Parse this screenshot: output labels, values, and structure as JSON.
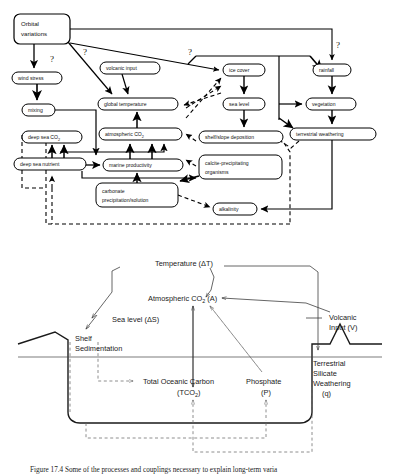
{
  "figure": {
    "caption_partial": "Figure 17.4    Some of the processes and couplings necessary to explain long-term varia"
  },
  "top_diagram": {
    "name": "climate-carbon-cycle-feedback-box-diagram",
    "nodes": [
      {
        "id": "orbital_variations",
        "label_lines": [
          "Orbital",
          "variations"
        ],
        "shape": "rounded-box",
        "x": 14,
        "y": 14,
        "w": 56,
        "h": 30
      },
      {
        "id": "wind_stress",
        "label": "wind stress",
        "shape": "pill",
        "x": 12,
        "y": 72,
        "w": 50,
        "h": 12
      },
      {
        "id": "mixing",
        "label": "mixing",
        "shape": "pill",
        "x": 22,
        "y": 104,
        "w": 33,
        "h": 12
      },
      {
        "id": "deep_sea_co2",
        "label": "deep sea CO",
        "sub": "2",
        "shape": "pill",
        "x": 22,
        "y": 131,
        "w": 60,
        "h": 12
      },
      {
        "id": "deep_sea_nutrient",
        "label": "deep sea nutrient",
        "shape": "pill",
        "x": 14,
        "y": 158,
        "w": 72,
        "h": 12
      },
      {
        "id": "volcanic_input",
        "label": "volcanic input",
        "shape": "pill",
        "x": 100,
        "y": 62,
        "w": 60,
        "h": 12
      },
      {
        "id": "global_temperature",
        "label": "global temperature",
        "shape": "pill",
        "x": 98,
        "y": 98,
        "w": 80,
        "h": 12
      },
      {
        "id": "atmospheric_co2",
        "label": "atmospheric   CO",
        "sub": "2",
        "shape": "pill",
        "x": 99,
        "y": 128,
        "w": 83,
        "h": 12
      },
      {
        "id": "marine_productivity",
        "label": "marine productivity",
        "shape": "pill",
        "x": 103,
        "y": 159,
        "w": 80,
        "h": 12
      },
      {
        "id": "carbonate_precip",
        "label_lines": [
          "carbonate",
          "precipitation/solution"
        ],
        "shape": "rounded-box",
        "x": 96,
        "y": 183,
        "w": 82,
        "h": 24
      },
      {
        "id": "ice_cover",
        "label": "ice cover",
        "shape": "pill",
        "x": 223,
        "y": 64,
        "w": 42,
        "h": 12
      },
      {
        "id": "sea_level",
        "label": "sea level",
        "shape": "pill",
        "x": 223,
        "y": 98,
        "w": 42,
        "h": 12
      },
      {
        "id": "shelf_slope_deposition",
        "label": "shelf/slope deposition",
        "shape": "pill",
        "x": 199,
        "y": 131,
        "w": 84,
        "h": 12
      },
      {
        "id": "calcite_organisms",
        "label_lines": [
          "calcite-precipitating",
          "organisms"
        ],
        "shape": "rounded-box",
        "x": 199,
        "y": 155,
        "w": 83,
        "h": 24
      },
      {
        "id": "alkalinity",
        "label": "alkalinity",
        "shape": "pill",
        "x": 213,
        "y": 203,
        "w": 44,
        "h": 12
      },
      {
        "id": "rainfall",
        "label": "rainfall",
        "shape": "pill",
        "x": 313,
        "y": 64,
        "w": 38,
        "h": 12
      },
      {
        "id": "vegetation",
        "label": "vegetation",
        "shape": "pill",
        "x": 306,
        "y": 98,
        "w": 50,
        "h": 12
      },
      {
        "id": "terrestrial_weathering",
        "label": "terrestrial  weathering",
        "shape": "pill",
        "x": 290,
        "y": 128,
        "w": 86,
        "h": 12
      }
    ],
    "uncertainty_marks": [
      {
        "label": "?",
        "x": 50,
        "y": 62
      },
      {
        "label": "?",
        "x": 83,
        "y": 55
      },
      {
        "label": "?",
        "x": 188,
        "y": 55
      },
      {
        "label": "?",
        "x": 336,
        "y": 48
      }
    ]
  },
  "bottom_diagram": {
    "name": "ocean-basin-carbon-model-schematic",
    "labels": [
      {
        "id": "temperature",
        "text": "Temperature (ΔT)",
        "x": 155,
        "y": 264
      },
      {
        "id": "atmospheric_co2_A",
        "text_pre": "Atmospheric CO",
        "sub": "2",
        "text_post": " (A)",
        "x": 148,
        "y": 300
      },
      {
        "id": "sea_level",
        "text": "Sea level (ΔS)",
        "x": 112,
        "y": 322
      },
      {
        "id": "volcanic_input",
        "lines": [
          "Volcanic",
          "Input  (V)"
        ],
        "x": 329,
        "y": 320
      },
      {
        "id": "shelf_sedimentation",
        "lines": [
          "Shelf",
          "Sedimentation"
        ],
        "x": 75,
        "y": 340
      },
      {
        "id": "terrestrial_silicate_weathering",
        "lines": [
          "Terrestrial",
          "Silicate",
          "Weathering",
          "(q)"
        ],
        "x": 308,
        "y": 364
      },
      {
        "id": "total_oceanic_carbon",
        "lines": [
          "Total  Oceanic  Carbon"
        ],
        "sub_line_pre": "(TCO",
        "sub": "2",
        "sub_line_post": ")",
        "x": 143,
        "y": 392
      },
      {
        "id": "phosphate",
        "lines": [
          "Phosphate"
        ],
        "sub_line": "(P)",
        "x": 258,
        "y": 392
      }
    ]
  }
}
